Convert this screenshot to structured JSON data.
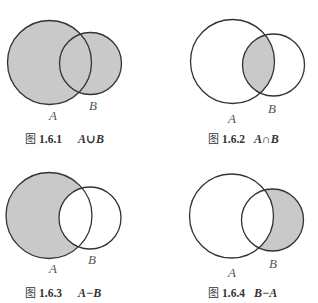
{
  "colors": {
    "shade": "#c9c9c9",
    "stroke": "#333333",
    "background": "#ffffff"
  },
  "figures": [
    {
      "id": "1.6.1",
      "caption_prefix": "图",
      "caption_number": "1.6.1",
      "caption_expr": "A∪B",
      "operation": "union",
      "label_a": "A",
      "label_b": "B",
      "shaded_region": "A or B"
    },
    {
      "id": "1.6.2",
      "caption_prefix": "图",
      "caption_number": "1.6.2",
      "caption_expr": "A∩B",
      "operation": "intersection",
      "label_a": "A",
      "label_b": "B",
      "shaded_region": "A and B"
    },
    {
      "id": "1.6.3",
      "caption_prefix": "图",
      "caption_number": "1.6.3",
      "caption_expr": "A−B",
      "operation": "difference",
      "label_a": "A",
      "label_b": "B",
      "shaded_region": "A not B"
    },
    {
      "id": "1.6.4",
      "caption_prefix": "图",
      "caption_number": "1.6.4",
      "caption_expr": "B−A",
      "operation": "difference",
      "label_a": "A",
      "label_b": "B",
      "shaded_region": "B not A"
    }
  ]
}
